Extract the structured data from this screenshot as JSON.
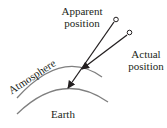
{
  "diagram": {
    "labels": {
      "apparent_line1": "Apparent",
      "apparent_line2": "position",
      "actual_line1": "Actual",
      "actual_line2": "position",
      "atmosphere": "Atmosphere",
      "earth": "Earth"
    },
    "colors": {
      "ink": "#231f20",
      "arc": "#7f7f7f",
      "background": "#ffffff"
    }
  }
}
